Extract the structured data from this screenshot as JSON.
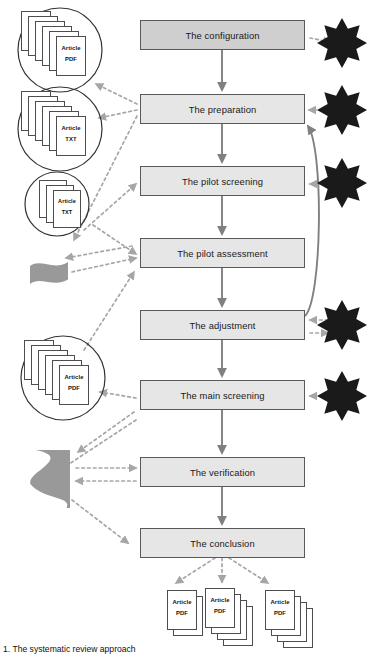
{
  "figure": {
    "caption": "1. The systematic review approach",
    "caption_y": 644
  },
  "colors": {
    "box_fill": "#e6e6e6",
    "box_fill_first": "#cfcfcf",
    "box_stroke": "#595959",
    "flow_arrow": "#808080",
    "dotted_arrow": "#a6a6a6",
    "star_fill": "#1a1a1a",
    "data_shape_fill": "#999999",
    "doc_stroke": "#4d4d4d",
    "text": "#1a1a1a"
  },
  "process_steps": [
    {
      "id": "configuration",
      "label": "The configuration",
      "x": 140,
      "y": 20,
      "w": 165,
      "h": 30,
      "emphasis": true
    },
    {
      "id": "preparation",
      "label": "The preparation",
      "x": 140,
      "y": 94,
      "w": 165,
      "h": 30,
      "emphasis": false
    },
    {
      "id": "pilot-screening",
      "label": "The pilot screening",
      "x": 140,
      "y": 166,
      "w": 165,
      "h": 30,
      "emphasis": false
    },
    {
      "id": "pilot-assessment",
      "label": "The pilot assessment",
      "x": 140,
      "y": 238,
      "w": 165,
      "h": 30,
      "emphasis": false
    },
    {
      "id": "adjustment",
      "label": "The adjustment",
      "x": 140,
      "y": 310,
      "w": 165,
      "h": 30,
      "emphasis": false
    },
    {
      "id": "main-screening",
      "label": "The main screening",
      "x": 140,
      "y": 380,
      "w": 165,
      "h": 30,
      "emphasis": false
    },
    {
      "id": "verification",
      "label": "The verification",
      "x": 140,
      "y": 457,
      "w": 165,
      "h": 30,
      "emphasis": false
    },
    {
      "id": "conclusion",
      "label": "The conclusion",
      "x": 140,
      "y": 528,
      "w": 165,
      "h": 30,
      "emphasis": false
    }
  ],
  "input_collections": [
    {
      "id": "pdf-corpus-large",
      "shape": "circle",
      "cx": 60,
      "cy": 50,
      "r": 42,
      "sheets": 6,
      "title": "Article",
      "format": "PDF",
      "sheet_w": 30,
      "sheet_h": 40,
      "front_x": 56,
      "front_y": 36,
      "step_x": -7,
      "step_y": -5
    },
    {
      "id": "txt-corpus-large",
      "shape": "circle",
      "cx": 60,
      "cy": 129,
      "r": 42,
      "sheets": 6,
      "title": "Article",
      "format": "TXT",
      "sheet_w": 30,
      "sheet_h": 40,
      "front_x": 56,
      "front_y": 116,
      "step_x": -7,
      "step_y": -5
    },
    {
      "id": "txt-corpus-small",
      "shape": "circle",
      "cx": 57,
      "cy": 204,
      "r": 32,
      "sheets": 3,
      "title": "Article",
      "format": "TXT",
      "sheet_w": 28,
      "sheet_h": 38,
      "front_x": 53,
      "front_y": 190,
      "step_x": -7,
      "step_y": -5
    },
    {
      "id": "pdf-corpus-screened",
      "shape": "circle",
      "cx": 63,
      "cy": 378,
      "r": 42,
      "sheets": 6,
      "title": "Article",
      "format": "PDF",
      "sheet_w": 30,
      "sheet_h": 40,
      "front_x": 59,
      "front_y": 365,
      "step_x": -7,
      "step_y": -5
    }
  ],
  "data_shapes": [
    {
      "id": "pilot-data-small",
      "x": 30,
      "y": 262,
      "w": 38,
      "h": 22,
      "label": ""
    },
    {
      "id": "verification-data-large",
      "x": 28,
      "y": 450,
      "w": 42,
      "h": 58,
      "label": ""
    }
  ],
  "stars": [
    {
      "id": "star-configuration",
      "cx": 342,
      "cy": 43,
      "r": 25,
      "points": 8
    },
    {
      "id": "star-preparation",
      "cx": 342,
      "cy": 110,
      "r": 25,
      "points": 8
    },
    {
      "id": "star-pilot-screening",
      "cx": 342,
      "cy": 183,
      "r": 25,
      "points": 8
    },
    {
      "id": "star-adjustment",
      "cx": 342,
      "cy": 325,
      "r": 25,
      "points": 8
    },
    {
      "id": "star-main-screening",
      "cx": 342,
      "cy": 396,
      "r": 25,
      "points": 8
    }
  ],
  "output_collections": [
    {
      "id": "output-stack-1",
      "sheets": 2,
      "title": "Article",
      "format": "PDF",
      "front_x": 167,
      "front_y": 590,
      "sheet_w": 30,
      "sheet_h": 40,
      "step_x": 6,
      "step_y": 6
    },
    {
      "id": "output-stack-2",
      "sheets": 4,
      "title": "Article",
      "format": "PDF",
      "front_x": 205,
      "front_y": 588,
      "sheet_w": 30,
      "sheet_h": 40,
      "step_x": 6,
      "step_y": 6
    },
    {
      "id": "output-stack-3",
      "sheets": 4,
      "title": "Article",
      "format": "PDF",
      "front_x": 265,
      "front_y": 590,
      "sheet_w": 30,
      "sheet_h": 40,
      "step_x": 6,
      "step_y": 6
    }
  ],
  "flow_connections": [
    {
      "from": "configuration",
      "to": "preparation",
      "type": "solid"
    },
    {
      "from": "preparation",
      "to": "pilot-screening",
      "type": "solid"
    },
    {
      "from": "pilot-screening",
      "to": "pilot-assessment",
      "type": "solid"
    },
    {
      "from": "pilot-assessment",
      "to": "adjustment",
      "type": "solid"
    },
    {
      "from": "adjustment",
      "to": "main-screening",
      "type": "solid"
    },
    {
      "from": "main-screening",
      "to": "verification",
      "type": "solid"
    },
    {
      "from": "verification",
      "to": "conclusion",
      "type": "solid"
    },
    {
      "from": "adjustment",
      "to": "preparation",
      "type": "solid-curved-feedback"
    }
  ]
}
